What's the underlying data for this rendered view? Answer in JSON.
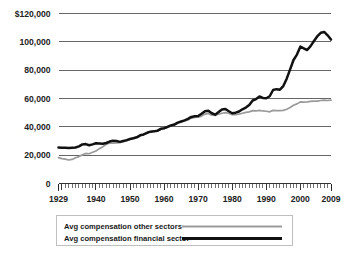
{
  "chart_data": {
    "type": "line",
    "title": "",
    "subtitle": "",
    "xlabel": "",
    "ylabel": "",
    "xlim": [
      1929,
      2009
    ],
    "ylim": [
      0,
      120000
    ],
    "grid": true,
    "legend_position": "bottom",
    "y_ticks": [
      0,
      20000,
      40000,
      60000,
      80000,
      100000,
      120000
    ],
    "y_tick_labels": [
      "0",
      "20,000",
      "40,000",
      "60,000",
      "80,000",
      "100,000",
      "$120,000"
    ],
    "x_ticks": [
      1929,
      1940,
      1950,
      1960,
      1970,
      1980,
      1990,
      2000,
      2009
    ],
    "x_tick_labels": [
      "1929",
      "1940",
      "1950",
      "1960",
      "1970",
      "1980",
      "1990",
      "2000",
      "2009"
    ],
    "x_minor_tick_step": 1,
    "x": [
      1929,
      1930,
      1931,
      1932,
      1933,
      1934,
      1935,
      1936,
      1937,
      1938,
      1939,
      1940,
      1941,
      1942,
      1943,
      1944,
      1945,
      1946,
      1947,
      1948,
      1949,
      1950,
      1951,
      1952,
      1953,
      1954,
      1955,
      1956,
      1957,
      1958,
      1959,
      1960,
      1961,
      1962,
      1963,
      1964,
      1965,
      1966,
      1967,
      1968,
      1969,
      1970,
      1971,
      1972,
      1973,
      1974,
      1975,
      1976,
      1977,
      1978,
      1979,
      1980,
      1981,
      1982,
      1983,
      1984,
      1985,
      1986,
      1987,
      1988,
      1989,
      1990,
      1991,
      1992,
      1993,
      1994,
      1995,
      1996,
      1997,
      1998,
      1999,
      2000,
      2001,
      2002,
      2003,
      2004,
      2005,
      2006,
      2007,
      2008,
      2009
    ],
    "series": [
      {
        "name": "Avg compensation other sectors",
        "color": "#9a9a9a",
        "values": [
          18300,
          17600,
          17200,
          16600,
          17000,
          18200,
          19000,
          20200,
          21200,
          21000,
          22000,
          23000,
          24600,
          26000,
          27600,
          28600,
          28400,
          28600,
          28800,
          29600,
          30000,
          31200,
          32000,
          32800,
          34200,
          34600,
          35800,
          36600,
          36800,
          37000,
          38200,
          38800,
          39600,
          40600,
          41400,
          42600,
          43400,
          44200,
          44800,
          46200,
          46600,
          46800,
          47600,
          49000,
          49400,
          48200,
          48000,
          49000,
          49600,
          50000,
          49600,
          48600,
          48600,
          49000,
          49600,
          50200,
          50600,
          51400,
          51200,
          51600,
          51200,
          51000,
          50600,
          51600,
          51400,
          51400,
          51600,
          52400,
          53600,
          55200,
          56200,
          57600,
          57400,
          57600,
          58000,
          58200,
          58200,
          58600,
          58800,
          58600,
          58800
        ]
      },
      {
        "name": "Avg compensation financial sector",
        "color": "#111111",
        "values": [
          25400,
          25300,
          25200,
          25000,
          25200,
          25400,
          26200,
          27600,
          27800,
          27000,
          27600,
          28400,
          28200,
          28000,
          28600,
          29600,
          30200,
          30000,
          29400,
          30000,
          30600,
          31400,
          32000,
          32600,
          34000,
          34600,
          35800,
          36600,
          36800,
          37200,
          38600,
          39000,
          40000,
          41000,
          41600,
          43000,
          43800,
          44600,
          45600,
          47000,
          47400,
          47600,
          49200,
          51000,
          51400,
          49600,
          48600,
          50400,
          52200,
          52600,
          51000,
          49600,
          50000,
          50800,
          52400,
          53600,
          55400,
          58600,
          59600,
          61400,
          60400,
          60200,
          61600,
          66000,
          66600,
          66200,
          68800,
          74000,
          80600,
          87200,
          91000,
          96600,
          95400,
          94200,
          97000,
          100600,
          104000,
          106400,
          107000,
          104600,
          101600
        ]
      }
    ]
  },
  "legend": {
    "items": [
      {
        "label": "Avg compensation other sectors",
        "color": "#9a9a9a",
        "weight": "thin"
      },
      {
        "label": "Avg compensation financial sector",
        "color": "#111111",
        "weight": "thick"
      }
    ]
  }
}
